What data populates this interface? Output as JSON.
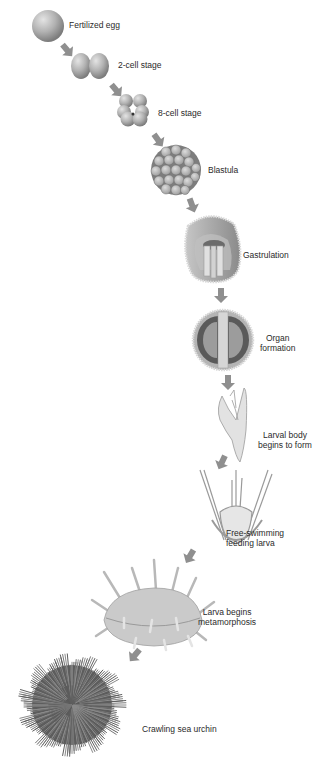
{
  "diagram": {
    "type": "developmental-sequence",
    "colors": {
      "arrow": "#8f8f8f",
      "cell_fill": "#b8b8b8",
      "cell_shadow": "#7d7d7d",
      "text": "#2a2a2a",
      "background": "#ffffff"
    },
    "stages": [
      {
        "id": "fertilized-egg",
        "label": "Fertilized egg"
      },
      {
        "id": "2-cell-stage",
        "label": "2-cell stage"
      },
      {
        "id": "8-cell-stage",
        "label": "8-cell stage"
      },
      {
        "id": "blastula",
        "label": "Blastula"
      },
      {
        "id": "gastrulation",
        "label": "Gastrulation"
      },
      {
        "id": "organ-formation",
        "label_line1": "Organ",
        "label_line2": "formation"
      },
      {
        "id": "larval-body",
        "label_line1": "Larval body",
        "label_line2": "begins to form"
      },
      {
        "id": "free-swimming-larva",
        "label_line1": "Free-swimming",
        "label_line2": "feeding larva"
      },
      {
        "id": "metamorphosis",
        "label_line1": "Larva begins",
        "label_line2": "metamorphosis"
      },
      {
        "id": "sea-urchin",
        "label": "Crawling sea urchin"
      }
    ]
  }
}
